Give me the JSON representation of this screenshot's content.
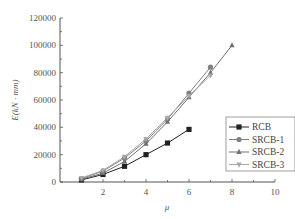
{
  "chart_data": {
    "type": "line",
    "title": "",
    "xlabel": "μ",
    "ylabel": "E(kN · mm)",
    "xlim": [
      0,
      10
    ],
    "ylim": [
      0,
      120000
    ],
    "xticks": [
      2,
      4,
      6,
      8,
      10
    ],
    "yticks": [
      0,
      20000,
      40000,
      60000,
      80000,
      100000,
      120000
    ],
    "grid": false,
    "legend_position": "lower right",
    "series": [
      {
        "name": "RCB",
        "marker": "square",
        "color": "#222222",
        "x": [
          1,
          2,
          3,
          4,
          5,
          6
        ],
        "values": [
          1500,
          5500,
          11500,
          20000,
          28500,
          38500
        ]
      },
      {
        "name": "SRCB-1",
        "marker": "circle",
        "color": "#808080",
        "x": [
          1,
          2,
          3,
          4,
          5,
          6,
          7
        ],
        "values": [
          2500,
          8000,
          17500,
          30000,
          46000,
          65000,
          84000
        ]
      },
      {
        "name": "SRCB-2",
        "marker": "triangle-up",
        "color": "#707070",
        "x": [
          1,
          2,
          3,
          4,
          5,
          6,
          7,
          8
        ],
        "values": [
          2000,
          6500,
          15000,
          28000,
          44000,
          62000,
          80000,
          100000
        ]
      },
      {
        "name": "SRCB-3",
        "marker": "triangle-down",
        "color": "#a8a8a8",
        "x": [
          1,
          2,
          3,
          4,
          5,
          6,
          7
        ],
        "values": [
          3000,
          8500,
          18500,
          31500,
          47000,
          63000,
          78000
        ]
      }
    ]
  },
  "labels": {
    "ylabel": "E(kN · mm)",
    "xlabel": "μ",
    "legend": [
      "RCB",
      "SRCB-1",
      "SRCB-2",
      "SRCB-3"
    ]
  }
}
